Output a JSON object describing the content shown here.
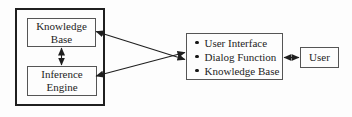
{
  "colors": {
    "background": "#fdfdfd",
    "text": "#242424",
    "thin_box_border": "#555555",
    "outer_box_border": "#1f1f1f",
    "arrow": "#1f1f1f"
  },
  "diagram": {
    "expert_system_group": {
      "knowledge_base_label": "Knowledge Base",
      "inference_engine_label": "Inference Engine"
    },
    "interface_box": {
      "items": [
        "User Interface",
        "Dialog Function",
        "Knowledge Base"
      ]
    },
    "user_label": "User"
  }
}
